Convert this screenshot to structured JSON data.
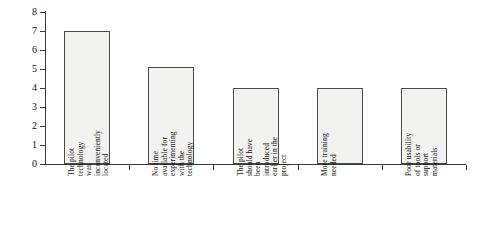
{
  "chart_data": {
    "type": "bar",
    "title": "",
    "subtitle": "",
    "xlabel": "",
    "ylabel": "",
    "ylim": [
      0,
      8
    ],
    "y_ticks": [
      0,
      1,
      2,
      3,
      4,
      5,
      6,
      7,
      8
    ],
    "grid": false,
    "legend": null,
    "orientation": "vertical",
    "bar_fill_color": "#f2f2f0",
    "bar_border_color": "#4a4a4a",
    "axis_color": "#3a3a3a",
    "background_color": "#ffffff",
    "categories": [
      "The pilot\ntechnology\nwas\ninconveniently\nlocated",
      "No time\navailable for\nexperimenting\nwith the\ntechnology",
      "The pilot\nshould have\nbeen\nintroduced\nearlier in the\nproject",
      "More training\nneeded",
      "Poor usability\nof tools or\nsupport\nmaterials"
    ],
    "values": [
      7,
      5.1,
      4,
      4,
      4
    ]
  }
}
